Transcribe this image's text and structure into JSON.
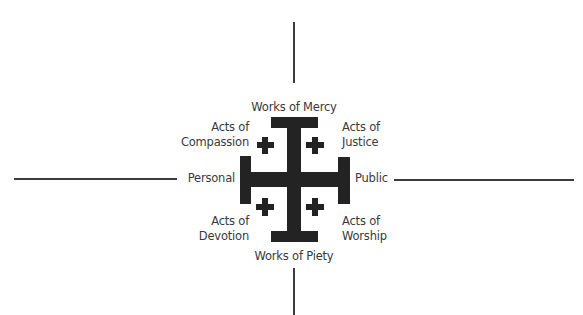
{
  "diagram": {
    "labels": {
      "top": "Works of Mercy",
      "bottom": "Works of Piety",
      "left": "Personal",
      "right": "Public",
      "top_left": [
        "Acts of",
        "Compassion"
      ],
      "top_right": [
        "Acts of",
        "Justice"
      ],
      "bottom_left": [
        "Acts of",
        "Devotion"
      ],
      "bottom_right": [
        "Acts of",
        "Worship"
      ]
    },
    "center_symbol": "jerusalem-cross",
    "colors": {
      "cross": "#232323",
      "axis_lines": "#3c3c3c",
      "text": "#3a3a3a",
      "background": "#ffffff"
    }
  }
}
